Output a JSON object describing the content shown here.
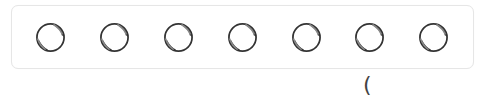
{
  "tray": {
    "label": "tennis-ball tray",
    "items": [
      {
        "name": "ball-1",
        "cx": 51
      },
      {
        "name": "ball-2",
        "cx": 115
      },
      {
        "name": "ball-3",
        "cx": 179
      },
      {
        "name": "ball-4",
        "cx": 243
      },
      {
        "name": "ball-5",
        "cx": 307
      },
      {
        "name": "ball-6",
        "cx": 370
      },
      {
        "name": "ball-7",
        "cx": 434
      }
    ],
    "count": 7,
    "icon": "tennis-ball-icon"
  },
  "caption": {
    "text": "("
  },
  "colors": {
    "border": "#e6e6e6",
    "ball_stroke": "#333333",
    "background": "#ffffff"
  }
}
